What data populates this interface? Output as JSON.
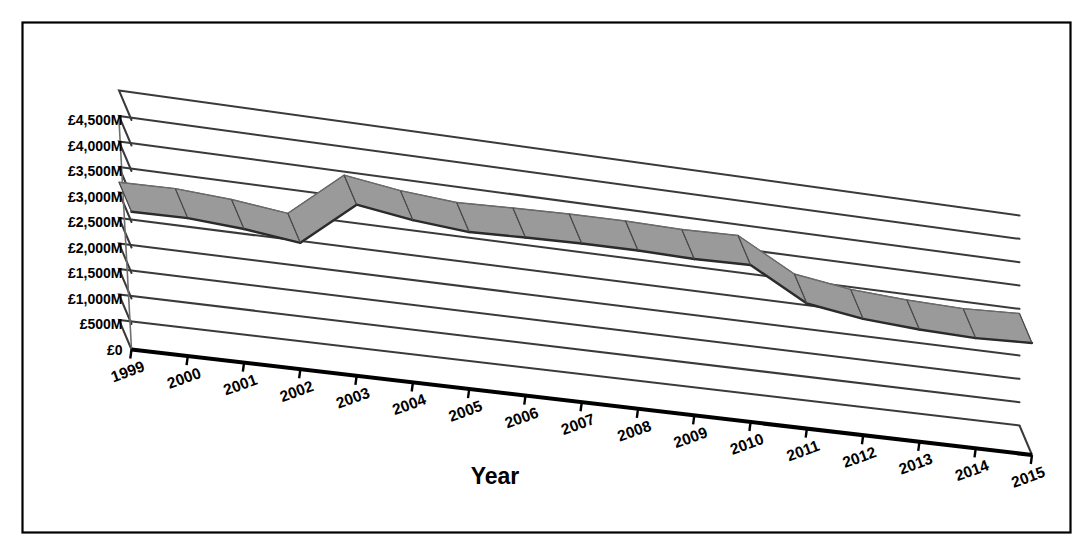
{
  "chart_data": {
    "type": "line",
    "title": "",
    "subtitle": "",
    "xlabel": "Year",
    "ylabel": "",
    "style": "3d-perspective-line",
    "grid": true,
    "legend": false,
    "legend_position": "none",
    "ylim": [
      0,
      4500
    ],
    "ytick_step": 500,
    "ytick_labels": [
      "£4,500M",
      "£4,000M",
      "£3,500M",
      "£3,000M",
      "£2,500M",
      "£2,000M",
      "£1,500M",
      "£1,000M",
      "£500M",
      "£0"
    ],
    "ytick_values": [
      4500,
      4000,
      3500,
      3000,
      2500,
      2000,
      1500,
      1000,
      500,
      0
    ],
    "categories": [
      "1999",
      "2000",
      "2001",
      "2002",
      "2003",
      "2004",
      "2005",
      "2006",
      "2007",
      "2008",
      "2009",
      "2010",
      "2011",
      "2012",
      "2013",
      "2014",
      "2015"
    ],
    "values": [
      2700,
      2720,
      2650,
      2520,
      3430,
      3270,
      3180,
      3220,
      3250,
      3260,
      3240,
      3270,
      2620,
      2450,
      2380,
      2350,
      2400
    ],
    "series": [
      {
        "name": "Value",
        "color": "#808080",
        "values": [
          2700,
          2720,
          2650,
          2520,
          3430,
          3270,
          3180,
          3220,
          3250,
          3260,
          3240,
          3270,
          2620,
          2450,
          2380,
          2350,
          2400
        ]
      }
    ],
    "annotations": []
  },
  "colors": {
    "border": "#000000",
    "background": "#ffffff",
    "gridline": "#3a3a3a",
    "axis": "#000000",
    "series_top": "#9a9a9a",
    "series_side": "#5a5a5a",
    "series_edge": "#2b2b2b"
  },
  "frame": {
    "border_label": "chart-border"
  }
}
